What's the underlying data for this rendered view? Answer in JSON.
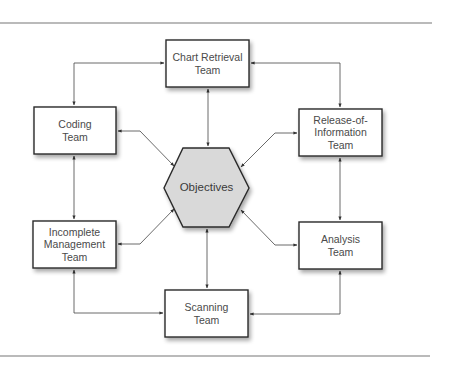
{
  "diagram": {
    "type": "hub-and-spoke",
    "colors": {
      "box_fill": "#ffffff",
      "box_stroke": "#2b2b2b",
      "hub_fill": "#d9d9d9",
      "hub_stroke": "#2b2b2b",
      "connector": "#444444",
      "rule": "#777777",
      "text": "#4a4a4a"
    },
    "hub": {
      "id": "objectives",
      "label": "Objectives",
      "shape": "hexagon"
    },
    "nodes": [
      {
        "id": "chart-retrieval",
        "label": "Chart Retrieval\nTeam"
      },
      {
        "id": "coding",
        "label": "Coding\nTeam"
      },
      {
        "id": "release-of-information",
        "label": "Release-of-\nInformation\nTeam"
      },
      {
        "id": "incomplete-management",
        "label": "Incomplete\nManagement\nTeam"
      },
      {
        "id": "analysis",
        "label": "Analysis\nTeam"
      },
      {
        "id": "scanning",
        "label": "Scanning\nTeam"
      }
    ],
    "edges": [
      {
        "from": "chart-retrieval",
        "to": "coding",
        "bidirectional": true
      },
      {
        "from": "chart-retrieval",
        "to": "release-of-information",
        "bidirectional": true
      },
      {
        "from": "chart-retrieval",
        "to": "objectives",
        "bidirectional": true
      },
      {
        "from": "coding",
        "to": "incomplete-management",
        "bidirectional": true
      },
      {
        "from": "coding",
        "to": "objectives",
        "bidirectional": true
      },
      {
        "from": "release-of-information",
        "to": "analysis",
        "bidirectional": true
      },
      {
        "from": "release-of-information",
        "to": "objectives",
        "bidirectional": true
      },
      {
        "from": "incomplete-management",
        "to": "scanning",
        "bidirectional": true
      },
      {
        "from": "incomplete-management",
        "to": "objectives",
        "bidirectional": true
      },
      {
        "from": "analysis",
        "to": "scanning",
        "bidirectional": true
      },
      {
        "from": "analysis",
        "to": "objectives",
        "bidirectional": true
      },
      {
        "from": "scanning",
        "to": "objectives",
        "bidirectional": true
      }
    ]
  }
}
